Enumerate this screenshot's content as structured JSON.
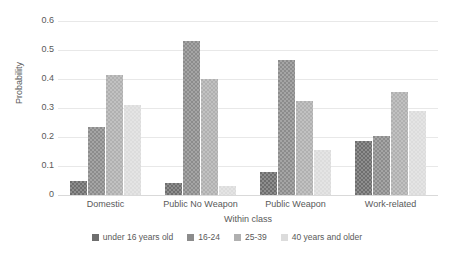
{
  "chart_data": {
    "type": "bar",
    "title": "",
    "xlabel": "Within class",
    "ylabel": "Probability",
    "categories": [
      "Domestic",
      "Public No Weapon",
      "Public Weapon",
      "Work-related"
    ],
    "series": [
      {
        "name": "under 16 years old",
        "values": [
          0.05,
          0.04,
          0.08,
          0.185
        ],
        "color": "#6e6e6e"
      },
      {
        "name": "16-24",
        "values": [
          0.235,
          0.53,
          0.465,
          0.205
        ],
        "color": "#8c8c8c"
      },
      {
        "name": "25-39",
        "values": [
          0.415,
          0.4,
          0.325,
          0.355
        ],
        "color": "#b0b0b0"
      },
      {
        "name": "40 years and older",
        "values": [
          0.31,
          0.03,
          0.155,
          0.29
        ],
        "color": "#dcdcdc"
      }
    ],
    "ylim": [
      0,
      0.6
    ],
    "yticks": [
      "0",
      "0.1",
      "0.2",
      "0.3",
      "0.4",
      "0.5",
      "0.6"
    ],
    "ytick_values": [
      0,
      0.1,
      0.2,
      0.3,
      0.4,
      0.5,
      0.6
    ],
    "grid": true,
    "legend_position": "bottom"
  }
}
